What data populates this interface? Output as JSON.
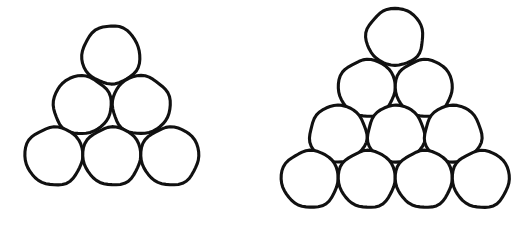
{
  "figure": {
    "background_color": "#ffffff",
    "stroke_color": "#111111",
    "fill_color": "#ffffff",
    "stroke_width": 3.1,
    "width": 532,
    "height": 231,
    "style": "hand-drawn outline"
  },
  "chart_data": {
    "type": "diagram",
    "groups": [
      {
        "name": "left-triangle",
        "label": "Triangle of 6 circles",
        "circle_count": 6,
        "row_counts": [
          1,
          2,
          3
        ],
        "diameter": 58,
        "radius": 29,
        "bounds": {
          "x_min": 25,
          "x_max": 199,
          "y_min": 26,
          "y_max": 185
        },
        "circles": [
          {
            "id": "L-r1-c1",
            "row": 1,
            "index": 1,
            "cx": 111,
            "cy": 55,
            "r": 29
          },
          {
            "id": "L-r2-c1",
            "row": 2,
            "index": 1,
            "cx": 82,
            "cy": 105,
            "r": 29
          },
          {
            "id": "L-r2-c2",
            "row": 2,
            "index": 2,
            "cx": 141,
            "cy": 105,
            "r": 29
          },
          {
            "id": "L-r3-c1",
            "row": 3,
            "index": 1,
            "cx": 54,
            "cy": 156,
            "r": 29
          },
          {
            "id": "L-r3-c2",
            "row": 3,
            "index": 2,
            "cx": 112,
            "cy": 156,
            "r": 29
          },
          {
            "id": "L-r3-c3",
            "row": 3,
            "index": 3,
            "cx": 170,
            "cy": 156,
            "r": 29
          }
        ]
      },
      {
        "name": "right-triangle",
        "label": "Triangle of 10 circles",
        "circle_count": 10,
        "row_counts": [
          1,
          2,
          3,
          4
        ],
        "diameter": 57,
        "radius": 28.5,
        "bounds": {
          "x_min": 281,
          "x_max": 510,
          "y_min": 9,
          "y_max": 207
        },
        "circles": [
          {
            "id": "R-r1-c1",
            "row": 1,
            "index": 1,
            "cx": 395,
            "cy": 37,
            "r": 28.5
          },
          {
            "id": "R-r2-c1",
            "row": 2,
            "index": 1,
            "cx": 367,
            "cy": 88,
            "r": 28.5
          },
          {
            "id": "R-r2-c2",
            "row": 2,
            "index": 2,
            "cx": 424,
            "cy": 88,
            "r": 28.5
          },
          {
            "id": "R-r3-c1",
            "row": 3,
            "index": 1,
            "cx": 338,
            "cy": 134,
            "r": 28.5
          },
          {
            "id": "R-r3-c2",
            "row": 3,
            "index": 2,
            "cx": 396,
            "cy": 134,
            "r": 28.5
          },
          {
            "id": "R-r3-c3",
            "row": 3,
            "index": 3,
            "cx": 453,
            "cy": 134,
            "r": 28.5
          },
          {
            "id": "R-r4-c1",
            "row": 4,
            "index": 1,
            "cx": 310,
            "cy": 179,
            "r": 28.5
          },
          {
            "id": "R-r4-c2",
            "row": 4,
            "index": 2,
            "cx": 367,
            "cy": 179,
            "r": 28.5
          },
          {
            "id": "R-r4-c3",
            "row": 4,
            "index": 3,
            "cx": 424,
            "cy": 179,
            "r": 28.5
          },
          {
            "id": "R-r4-c4",
            "row": 4,
            "index": 4,
            "cx": 481,
            "cy": 179,
            "r": 28.5
          }
        ]
      }
    ]
  }
}
